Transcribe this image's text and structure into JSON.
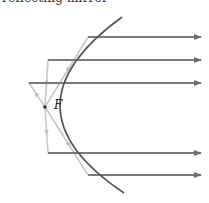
{
  "caption_partial": "reflecting mirror",
  "focus": {
    "label": "F",
    "x": 45,
    "y": 107
  },
  "colors": {
    "mirror": "#555555",
    "ray_out": "#7a7a7a",
    "ray_in": "#c8c8c8",
    "focus_dot": "#333333"
  },
  "mirror": {
    "top": [
      122,
      17
    ],
    "vertex": [
      19,
      108
    ],
    "bottom": [
      124,
      193
    ]
  },
  "rays": [
    {
      "reflect_x": 88,
      "y": 37,
      "end_x": 201
    },
    {
      "reflect_x": 48,
      "y": 60,
      "end_x": 201
    },
    {
      "reflect_x": 29,
      "y": 83,
      "end_x": 201
    },
    {
      "reflect_x": 48,
      "y": 153,
      "end_x": 201
    },
    {
      "reflect_x": 88,
      "y": 175,
      "end_x": 201
    }
  ]
}
